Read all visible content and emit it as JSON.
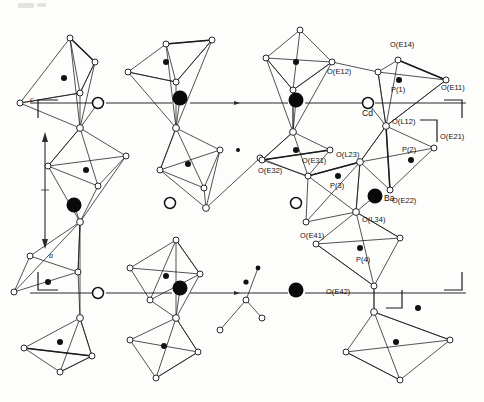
{
  "figure": {
    "type": "crystal-structure-projection",
    "caption_marks": [
      "c",
      "a"
    ],
    "background": "#fdfdfc",
    "line_color": "#1a1a1a"
  },
  "axes": [
    {
      "name": "c",
      "label": "c"
    },
    {
      "name": "a",
      "label": "a"
    }
  ],
  "atom_types": [
    {
      "key": "O",
      "label": "O",
      "style": "open-circle-small",
      "color": "#ffffff"
    },
    {
      "key": "P",
      "label": "P",
      "style": "filled-circle-small",
      "color": "#111111"
    },
    {
      "key": "Ba",
      "label": "Ba",
      "style": "filled-circle-large",
      "color": "#0a0a0a"
    },
    {
      "key": "Cd",
      "label": "Cd",
      "style": "open-circle-large",
      "color": "#ffffff"
    }
  ],
  "labels": [
    {
      "id": "oe14",
      "text": "O(E14)",
      "x": 390,
      "y": 47
    },
    {
      "id": "oe12",
      "text": "O(E12)",
      "x": 327,
      "y": 74
    },
    {
      "id": "oe11",
      "text": "O(E11)",
      "x": 441,
      "y": 90
    },
    {
      "id": "p1",
      "text": "P(1)",
      "x": 398,
      "y": 90
    },
    {
      "id": "cd",
      "text": "Cd",
      "x": 362,
      "y": 116
    },
    {
      "id": "ol12",
      "text": "O(L12)",
      "x": 404,
      "y": 122
    },
    {
      "id": "oe21",
      "text": "O(E21)",
      "x": 440,
      "y": 139
    },
    {
      "id": "p2",
      "text": "P(2)",
      "x": 409,
      "y": 152
    },
    {
      "id": "ol23",
      "text": "O(L23)",
      "x": 372,
      "y": 158
    },
    {
      "id": "oe31",
      "text": "O(E31)",
      "x": 327,
      "y": 163
    },
    {
      "id": "oe32",
      "text": "O(E32)",
      "x": 272,
      "y": 173
    },
    {
      "id": "p3",
      "text": "P(3)",
      "x": 338,
      "y": 185
    },
    {
      "id": "oe22",
      "text": "O(E22)",
      "x": 398,
      "y": 188
    },
    {
      "id": "ba",
      "text": "Ba",
      "x": 390,
      "y": 199
    },
    {
      "id": "ol34",
      "text": "O(L34)",
      "x": 368,
      "y": 215
    },
    {
      "id": "oe41",
      "text": "O(E41)",
      "x": 320,
      "y": 237
    },
    {
      "id": "p4",
      "text": "P(4)",
      "x": 363,
      "y": 259
    },
    {
      "id": "oe42",
      "text": "O(E42)",
      "x": 335,
      "y": 291
    }
  ],
  "guide_lines": [
    {
      "id": "guide-top",
      "y": 103,
      "x1": 30,
      "x2": 466
    },
    {
      "id": "guide-bottom",
      "y": 293,
      "x1": 30,
      "x2": 466
    }
  ],
  "cd_row_top": [
    {
      "x": 98,
      "y": 103
    },
    {
      "x": 368,
      "y": 103
    }
  ],
  "cd_row_middle": [
    {
      "x": 170,
      "y": 203
    },
    {
      "x": 296,
      "y": 203
    }
  ],
  "cd_row_bottom": [
    {
      "x": 98,
      "y": 293
    }
  ],
  "ba_row_top": [
    {
      "x": 180,
      "y": 98
    },
    {
      "x": 296,
      "y": 100
    }
  ],
  "ba_row_middle": [
    {
      "x": 74,
      "y": 205
    },
    {
      "x": 375,
      "y": 196
    }
  ],
  "ba_row_bottom": [
    {
      "x": 180,
      "y": 288
    },
    {
      "x": 296,
      "y": 290
    }
  ],
  "brackets": [
    {
      "id": "bracket-c-top",
      "orient": "top-left",
      "x": 38,
      "y": 100
    },
    {
      "id": "bracket-c-bottom",
      "orient": "bottom-left",
      "x": 38,
      "y": 290
    },
    {
      "id": "bracket-right-top",
      "orient": "top-right",
      "x": 448,
      "y": 100
    },
    {
      "id": "bracket-right-bottom",
      "orient": "bottom-right",
      "x": 448,
      "y": 290
    },
    {
      "id": "bracket-mid-right",
      "orient": "mid-right",
      "x": 430,
      "y": 120
    },
    {
      "id": "bracket-mid-low",
      "orient": "mid-low",
      "x": 430,
      "y": 270
    }
  ]
}
